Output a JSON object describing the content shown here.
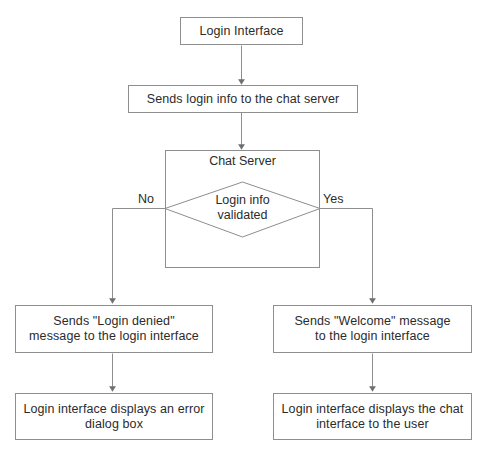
{
  "diagram": {
    "type": "flowchart",
    "colors": {
      "stroke": "#8e8e8e",
      "text": "#2b2b2b",
      "background": "#ffffff"
    },
    "nodes": {
      "login_interface": "Login Interface",
      "sends_login_info": "Sends login info to the chat server",
      "chat_server": "Chat Server",
      "decision_line1": "Login info",
      "decision_line2": "validated",
      "denied_line1": "Sends \"Login denied\"",
      "denied_line2": "message to the login interface",
      "welcome_line1": "Sends \"Welcome\" message",
      "welcome_line2": "to the login interface",
      "error_line1": "Login interface displays an error",
      "error_line2": "dialog box",
      "chat_line1": "Login interface displays the chat",
      "chat_line2": "interface to the user"
    },
    "edge_labels": {
      "no": "No",
      "yes": "Yes"
    }
  }
}
